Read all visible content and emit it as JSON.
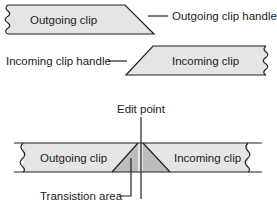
{
  "top_diagram": {
    "outgoing_clip": {
      "label": "Outgoing clip",
      "handle_label": "Outgoing clip handle"
    },
    "incoming_clip": {
      "label": "Incoming clip",
      "handle_label": "Incoming clip handle"
    }
  },
  "bottom_diagram": {
    "edit_point_label": "Edit point",
    "outgoing_clip_label": "Outgoing clip",
    "incoming_clip_label": "Incoming clip",
    "transition_area_label": "Transistion area"
  },
  "colors": {
    "clip_fill": "#e5e5e5",
    "transition_fill": "#bcbcbc",
    "line": "#222222"
  }
}
